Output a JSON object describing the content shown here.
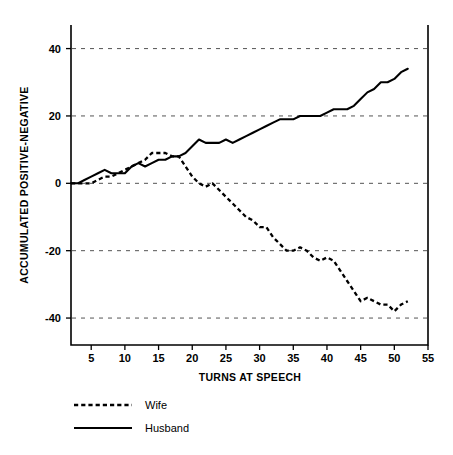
{
  "chart_data": {
    "type": "line",
    "title": "",
    "xlabel": "TURNS AT SPEECH",
    "ylabel": "ACCUMULATED POSITIVE-NEGATIVE",
    "xlim": [
      2,
      55
    ],
    "ylim": [
      -48,
      47
    ],
    "xticks": [
      5,
      10,
      15,
      20,
      25,
      30,
      35,
      40,
      45,
      50,
      55
    ],
    "yticks": [
      -40,
      -20,
      0,
      20,
      40
    ],
    "grid": true,
    "grid_axis": "y",
    "grid_style": "dashed",
    "legend_position": "below-left",
    "series": [
      {
        "name": "Wife",
        "style": "dashed",
        "color": "#000000",
        "x": [
          2,
          3,
          4,
          5,
          6,
          7,
          8,
          9,
          10,
          11,
          12,
          13,
          14,
          15,
          16,
          17,
          18,
          19,
          20,
          21,
          22,
          23,
          24,
          25,
          26,
          27,
          28,
          29,
          30,
          31,
          32,
          33,
          34,
          35,
          36,
          37,
          38,
          39,
          40,
          41,
          42,
          43,
          44,
          45,
          46,
          47,
          48,
          49,
          50,
          51,
          52
        ],
        "values": [
          0,
          0,
          0,
          0,
          1,
          2,
          2,
          3,
          4,
          5,
          6,
          7,
          9,
          9,
          9,
          8,
          8,
          5,
          2,
          0,
          -1,
          0,
          -2,
          -4,
          -6,
          -8,
          -10,
          -11,
          -13,
          -13,
          -16,
          -18,
          -20,
          -20,
          -19,
          -20,
          -22,
          -23,
          -22,
          -23,
          -26,
          -29,
          -32,
          -35,
          -34,
          -35,
          -36,
          -36,
          -38,
          -36,
          -35
        ]
      },
      {
        "name": "Husband",
        "style": "solid",
        "color": "#000000",
        "x": [
          2,
          3,
          4,
          5,
          6,
          7,
          8,
          9,
          10,
          11,
          12,
          13,
          14,
          15,
          16,
          17,
          18,
          19,
          20,
          21,
          22,
          23,
          24,
          25,
          26,
          27,
          28,
          29,
          30,
          31,
          32,
          33,
          34,
          35,
          36,
          37,
          38,
          39,
          40,
          41,
          42,
          43,
          44,
          45,
          46,
          47,
          48,
          49,
          50,
          51,
          52
        ],
        "values": [
          0,
          0,
          1,
          2,
          3,
          4,
          3,
          3,
          3,
          5,
          6,
          5,
          6,
          7,
          7,
          8,
          8,
          9,
          11,
          13,
          12,
          12,
          12,
          13,
          12,
          13,
          14,
          15,
          16,
          17,
          18,
          19,
          19,
          19,
          20,
          20,
          20,
          20,
          21,
          22,
          22,
          22,
          23,
          25,
          27,
          28,
          30,
          30,
          31,
          33,
          34
        ]
      }
    ]
  },
  "legend": {
    "entries": [
      {
        "label": "Wife"
      },
      {
        "label": "Husband"
      }
    ]
  }
}
